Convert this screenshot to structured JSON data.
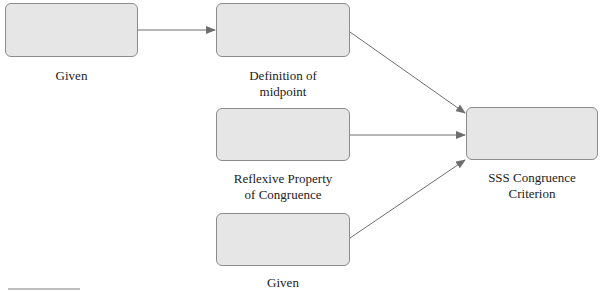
{
  "diagram": {
    "type": "flowchart-proof",
    "nodes": [
      {
        "id": "given-1",
        "label": "Given",
        "box_text": ""
      },
      {
        "id": "definition-of-midpoint",
        "label": "Definition of midpoint",
        "label_lines": [
          "Definition of",
          "midpoint"
        ],
        "box_text": ""
      },
      {
        "id": "reflexive-property",
        "label": "Reflexive Property of Congruence",
        "label_lines": [
          "Reflexive Property",
          "of Congruence"
        ],
        "box_text": ""
      },
      {
        "id": "given-2",
        "label": "Given",
        "box_text": ""
      },
      {
        "id": "sss-congruence",
        "label": "SSS Congruence Criterion",
        "label_lines": [
          "SSS Congruence",
          "Criterion"
        ],
        "box_text": ""
      }
    ],
    "edges": [
      {
        "from": "given-1",
        "to": "definition-of-midpoint"
      },
      {
        "from": "definition-of-midpoint",
        "to": "sss-congruence"
      },
      {
        "from": "reflexive-property",
        "to": "sss-congruence"
      },
      {
        "from": "given-2",
        "to": "sss-congruence"
      }
    ],
    "colors": {
      "box_fill": "#e6e6e6",
      "box_border": "#8c8c8c",
      "arrow": "#6e6e6e"
    }
  }
}
